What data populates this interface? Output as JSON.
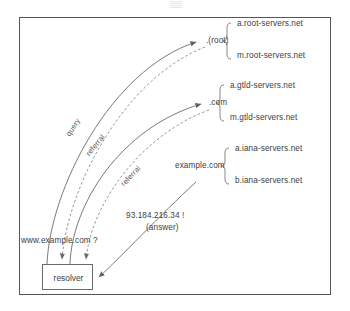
{
  "diagram": {
    "border_color": "#555555",
    "line_color": "#6a6a6a",
    "text_color": "#404040"
  },
  "resolver": {
    "label": "resolver"
  },
  "client": {
    "question": "www.example.com ?",
    "answer_value": "93.184.216.34 !",
    "answer_caption": "(answer)"
  },
  "zones": [
    {
      "name": ".(root)",
      "servers": [
        "a.root-servers.net",
        "m.root-servers.net"
      ]
    },
    {
      "name": ".com",
      "servers": [
        "a.gtld-servers.net",
        "m.gtld-servers.net"
      ]
    },
    {
      "name": "example.com",
      "servers": [
        "a.iana-servers.net",
        "b.iana-servers.net"
      ]
    }
  ],
  "edges": [
    {
      "label": "query",
      "style": "solid"
    },
    {
      "label": "referral",
      "style": "dashed"
    },
    {
      "label": "referral",
      "style": "dashed"
    }
  ]
}
